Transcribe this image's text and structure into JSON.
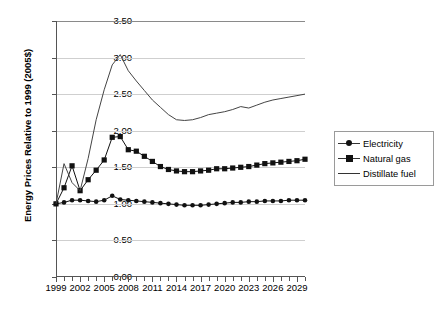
{
  "chart_data": {
    "type": "line",
    "title": "",
    "xlabel": "",
    "ylabel": "Energy Prices Relative to 1999 (2005$)",
    "ylim": [
      0.0,
      3.5
    ],
    "ytick_step": 0.5,
    "ytick_labels": [
      "0.00",
      "0.50",
      "1.00",
      "1.50",
      "2.00",
      "2.50",
      "3.00",
      "3.50"
    ],
    "xlim": [
      1999,
      2030
    ],
    "xtick_labels": [
      "1999",
      "2002",
      "2005",
      "2008",
      "2011",
      "2014",
      "2017",
      "2020",
      "2023",
      "2026",
      "2029"
    ],
    "xtick_label_step": 3,
    "grid": true,
    "legend_position": "right",
    "x": [
      1999,
      2000,
      2001,
      2002,
      2003,
      2004,
      2005,
      2006,
      2007,
      2008,
      2009,
      2010,
      2011,
      2012,
      2013,
      2014,
      2015,
      2016,
      2017,
      2018,
      2019,
      2020,
      2021,
      2022,
      2023,
      2024,
      2025,
      2026,
      2027,
      2028,
      2029,
      2030
    ],
    "series": [
      {
        "name": "Electricity",
        "marker": "circle",
        "color": "#111111",
        "values": [
          1.0,
          1.02,
          1.05,
          1.05,
          1.04,
          1.03,
          1.05,
          1.11,
          1.06,
          1.05,
          1.04,
          1.03,
          1.02,
          1.01,
          1.0,
          0.99,
          0.98,
          0.98,
          0.98,
          0.99,
          1.0,
          1.01,
          1.02,
          1.02,
          1.03,
          1.03,
          1.04,
          1.04,
          1.04,
          1.05,
          1.05,
          1.05
        ]
      },
      {
        "name": "Natural gas",
        "marker": "square",
        "color": "#111111",
        "values": [
          1.0,
          1.22,
          1.52,
          1.18,
          1.33,
          1.46,
          1.6,
          1.91,
          1.92,
          1.74,
          1.72,
          1.65,
          1.58,
          1.51,
          1.47,
          1.45,
          1.44,
          1.44,
          1.45,
          1.46,
          1.48,
          1.48,
          1.49,
          1.5,
          1.51,
          1.53,
          1.55,
          1.56,
          1.57,
          1.58,
          1.59,
          1.61
        ]
      },
      {
        "name": "Distillate fuel",
        "marker": "none",
        "color": "#444444",
        "values": [
          1.0,
          1.55,
          1.29,
          1.18,
          1.62,
          2.15,
          2.56,
          2.9,
          3.04,
          2.82,
          2.68,
          2.55,
          2.42,
          2.32,
          2.22,
          2.15,
          2.14,
          2.15,
          2.18,
          2.22,
          2.24,
          2.26,
          2.29,
          2.33,
          2.31,
          2.35,
          2.39,
          2.42,
          2.44,
          2.46,
          2.48,
          2.5
        ]
      }
    ],
    "legend_entries": [
      "Electricity",
      "Natural gas",
      "Distillate fuel"
    ]
  },
  "legend": {
    "items": [
      {
        "label": "Electricity"
      },
      {
        "label": "Natural gas"
      },
      {
        "label": "Distillate fuel"
      }
    ]
  },
  "axis": {
    "y_title": "Energy Prices Relative to 1999 (2005$)"
  }
}
